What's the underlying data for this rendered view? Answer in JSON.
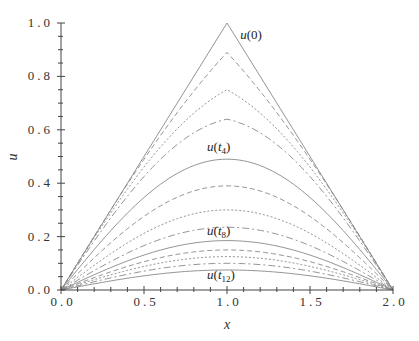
{
  "chart_data": {
    "type": "line",
    "title": "",
    "xlabel": "x",
    "ylabel": "u",
    "xlim": [
      0,
      2
    ],
    "ylim": [
      0,
      1
    ],
    "x_ticks": [
      "0.0",
      "0.5",
      "1.0",
      "1.5",
      "2.0"
    ],
    "y_ticks": [
      "0.0",
      "0.2",
      "0.4",
      "0.6",
      "0.8",
      "1.0"
    ],
    "grid": false,
    "legend": "none",
    "line_color": "#888888",
    "series": [
      {
        "name": "u(0)",
        "shape": "triangle",
        "peak": 1.0,
        "style": "solid"
      },
      {
        "name": "u(t1)",
        "shape": "arch",
        "peak": 0.89,
        "style": "dashed"
      },
      {
        "name": "u(t2)",
        "shape": "arch",
        "peak": 0.75,
        "style": "dotted"
      },
      {
        "name": "u(t3)",
        "shape": "arch",
        "peak": 0.64,
        "style": "dashdot"
      },
      {
        "name": "u(t4)",
        "shape": "arch",
        "peak": 0.49,
        "style": "solid"
      },
      {
        "name": "u(t5)",
        "shape": "arch",
        "peak": 0.39,
        "style": "dashed"
      },
      {
        "name": "u(t6)",
        "shape": "arch",
        "peak": 0.3,
        "style": "dotted"
      },
      {
        "name": "u(t7)",
        "shape": "arch",
        "peak": 0.235,
        "style": "dashdot"
      },
      {
        "name": "u(t8)",
        "shape": "arch",
        "peak": 0.185,
        "style": "solid"
      },
      {
        "name": "u(t9)",
        "shape": "arch",
        "peak": 0.15,
        "style": "dashed"
      },
      {
        "name": "u(t10)",
        "shape": "arch",
        "peak": 0.125,
        "style": "dotted"
      },
      {
        "name": "u(t11)",
        "shape": "arch",
        "peak": 0.1,
        "style": "dashdot"
      },
      {
        "name": "u(t12)",
        "shape": "arch",
        "peak": 0.075,
        "style": "solid"
      }
    ],
    "annotations": [
      {
        "base": "u(",
        "sym": "0",
        "sub": "",
        "close": ")",
        "x": 1.08,
        "y": 0.94
      },
      {
        "base": "u(",
        "sym": "t",
        "sub": "4",
        "close": ")",
        "x": 0.88,
        "y": 0.52
      },
      {
        "base": "u(",
        "sym": "t",
        "sub": "8",
        "close": ")",
        "x": 0.88,
        "y": 0.205
      },
      {
        "base": "u(",
        "sym": "t",
        "sub": "12",
        "close": ")",
        "x": 0.88,
        "y": 0.04
      }
    ]
  }
}
